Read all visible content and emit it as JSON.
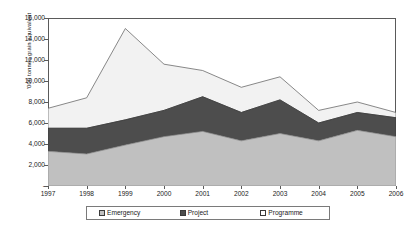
{
  "chart_data": {
    "type": "area",
    "stacked": true,
    "title": "",
    "xlabel": "",
    "ylabel": "'000 tonnes grain equivalent",
    "categories": [
      "1997",
      "1998",
      "1999",
      "2000",
      "2001",
      "2002",
      "2003",
      "2004",
      "2005",
      "2006"
    ],
    "x": [
      1997,
      1998,
      1999,
      2000,
      2001,
      2002,
      2003,
      2004,
      2005,
      2006
    ],
    "ylim": [
      0,
      16000
    ],
    "ytick_values": [
      0,
      2000,
      4000,
      6000,
      8000,
      10000,
      12000,
      14000,
      16000
    ],
    "ytick_labels": [
      "-",
      "2,000",
      "4,000",
      "6,000",
      "8,000",
      "10,000",
      "12,000",
      "14,000",
      "16,000"
    ],
    "grid": false,
    "legend_position": "bottom",
    "series": [
      {
        "name": "Emergency",
        "color": "#c0c0c0",
        "values": [
          3300,
          3050,
          3900,
          4700,
          5200,
          4300,
          5000,
          4300,
          5300,
          4700
        ]
      },
      {
        "name": "Project",
        "color": "#4d4d4d",
        "values": [
          2200,
          2450,
          2400,
          2500,
          3300,
          2700,
          3200,
          1700,
          1700,
          1800
        ]
      },
      {
        "name": "Programme",
        "color": "#f2f2f2",
        "values": [
          1900,
          2900,
          8700,
          4400,
          2500,
          2400,
          2200,
          1200,
          1000,
          500
        ]
      }
    ],
    "cumulative_totals": [
      7400,
      8400,
      15000,
      11600,
      11000,
      9400,
      10400,
      7200,
      8000,
      7000
    ]
  },
  "legend": {
    "items": [
      {
        "label": "Emergency",
        "swatch_color": "#c0c0c0"
      },
      {
        "label": "Project",
        "swatch_color": "#4d4d4d"
      },
      {
        "label": "Programme",
        "swatch_color": "#ffffff"
      }
    ]
  },
  "colors": {
    "emergency": "#c0c0c0",
    "project": "#4d4d4d",
    "programme": "#f2f2f2",
    "axis": "#5a5a5a",
    "text": "#1a1a1a",
    "background": "#ffffff"
  }
}
